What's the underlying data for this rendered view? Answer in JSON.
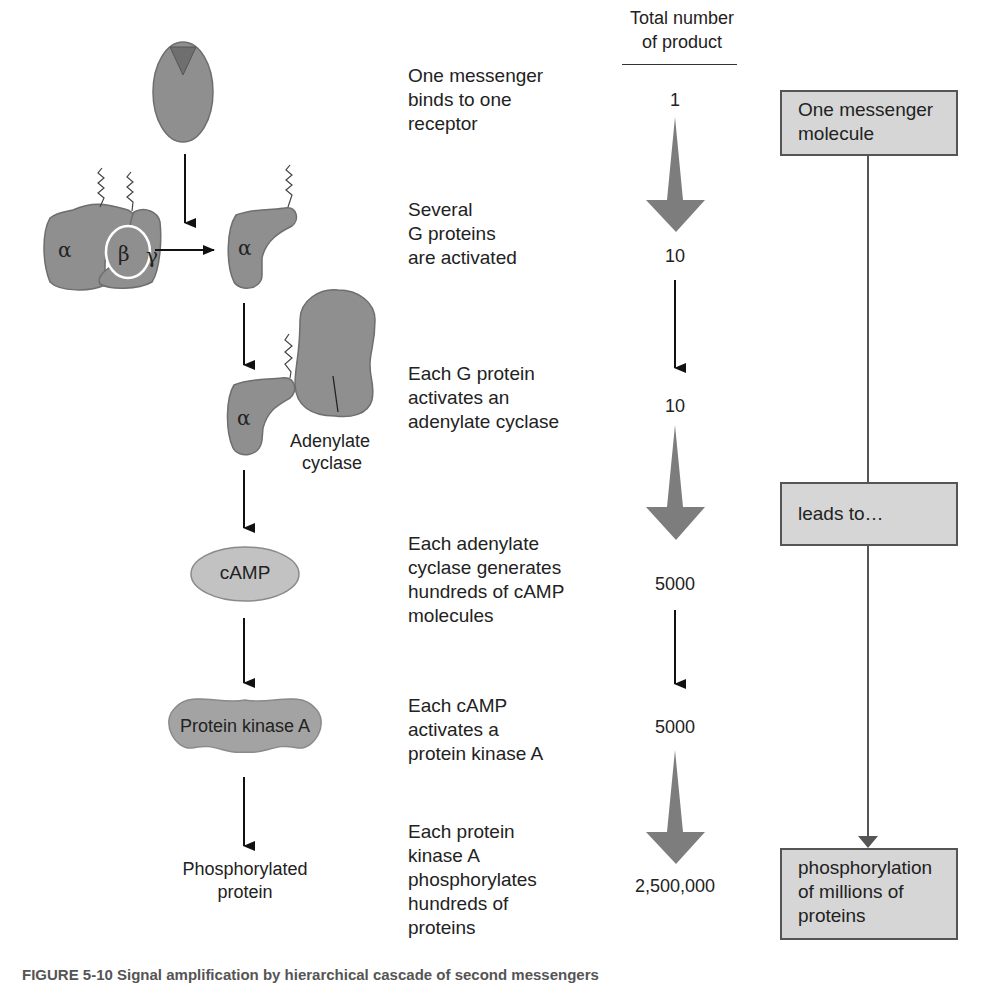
{
  "header": {
    "column_title_line1": "Total number",
    "column_title_line2": "of product"
  },
  "left_diagram": {
    "g_protein_subunits": [
      "α",
      "β",
      "γ"
    ],
    "activated_alpha_label": "α",
    "alpha_with_cyclase_label": "α",
    "adenylate_cyclase_label_line1": "Adenylate",
    "adenylate_cyclase_label_line2": "cyclase",
    "camp_label": "cAMP",
    "pka_label": "Protein kinase A",
    "product_label_line1": "Phosphorylated",
    "product_label_line2": "protein"
  },
  "steps": [
    {
      "lines": [
        "One messenger",
        "binds to one",
        "receptor"
      ],
      "count": "1"
    },
    {
      "lines": [
        "Several",
        "G proteins",
        "are activated"
      ],
      "count": "10"
    },
    {
      "lines": [
        "Each G protein",
        "activates an",
        "adenylate cyclase"
      ],
      "count": "10"
    },
    {
      "lines": [
        "Each adenylate",
        "cyclase generates",
        "hundreds of cAMP",
        "molecules"
      ],
      "count": "5000"
    },
    {
      "lines": [
        "Each cAMP",
        "activates a",
        "protein kinase A"
      ],
      "count": "5000"
    },
    {
      "lines": [
        "Each protein",
        "kinase A",
        "phosphorylates",
        "hundreds of",
        "proteins"
      ],
      "count": "2,500,000"
    }
  ],
  "summary_boxes": [
    {
      "lines": [
        "One messenger",
        "molecule"
      ]
    },
    {
      "lines": [
        "leads to…"
      ]
    },
    {
      "lines": [
        "phosphorylation",
        "of millions of",
        "proteins"
      ]
    }
  ],
  "caption": "FIGURE 5-10  Signal amplification by hierarchical cascade of second messengers",
  "colors": {
    "protein_fill": "#8f8f8f",
    "protein_stroke": "#6e6e6e",
    "ligand_fill": "#6f6f6f",
    "big_arrow_fill": "#7d7d7d",
    "box_fill": "#d6d6d6",
    "box_border": "#555555"
  }
}
